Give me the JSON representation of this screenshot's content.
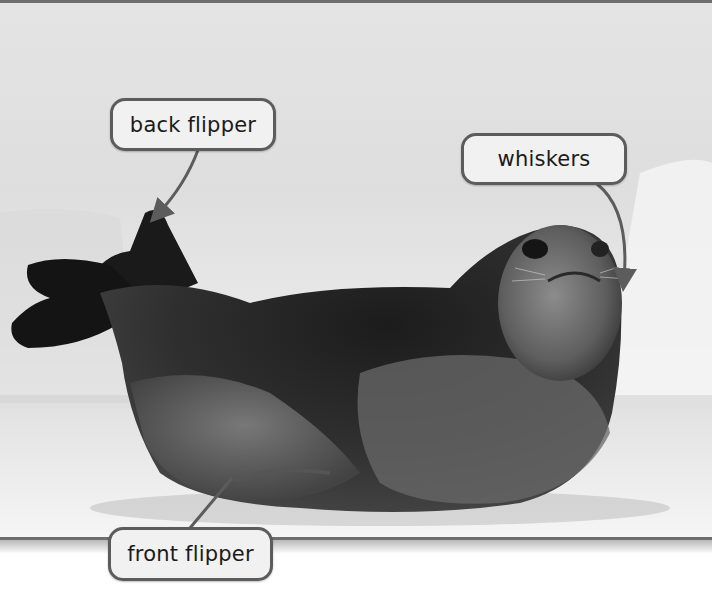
{
  "figure": {
    "style": "grayscale photo with callout labels",
    "colors": {
      "label_border": "#5c5c5c",
      "label_fill": "#f1f1f1",
      "label_text": "#1a1a1a",
      "pointer": "#5c5c5c",
      "photo_border": "#6e6e6e",
      "page_background": "#ffffff"
    }
  },
  "labels": [
    {
      "id": "back-flipper",
      "text": "back flipper"
    },
    {
      "id": "whiskers",
      "text": "whiskers"
    },
    {
      "id": "front-flipper",
      "text": "front flipper"
    }
  ]
}
